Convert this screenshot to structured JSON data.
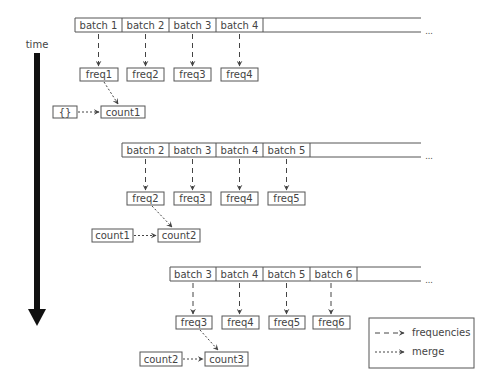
{
  "time_axis": {
    "label": "time"
  },
  "ellipsis": "...",
  "rows": [
    {
      "batches": [
        "batch 1",
        "batch 2",
        "batch 3",
        "batch 4"
      ],
      "freqs": [
        "freq1",
        "freq2",
        "freq3",
        "freq4"
      ],
      "prev": "{}",
      "count": "count1"
    },
    {
      "batches": [
        "batch 2",
        "batch 3",
        "batch 4",
        "batch 5"
      ],
      "freqs": [
        "freq2",
        "freq3",
        "freq4",
        "freq5"
      ],
      "prev": "count1",
      "count": "count2"
    },
    {
      "batches": [
        "batch 3",
        "batch 4",
        "batch 5",
        "batch 6"
      ],
      "freqs": [
        "freq3",
        "freq4",
        "freq5",
        "freq6"
      ],
      "prev": "count2",
      "count": "count3"
    }
  ],
  "legend": {
    "items": [
      {
        "style": "dashed",
        "label": "frequencies"
      },
      {
        "style": "dotted",
        "label": "merge"
      }
    ]
  }
}
